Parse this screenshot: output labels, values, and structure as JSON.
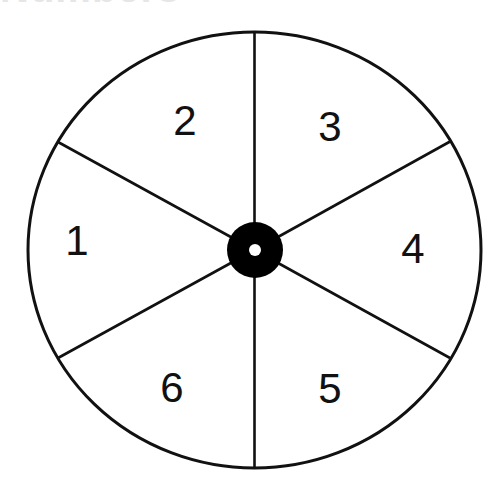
{
  "title_fragment": "Numbers",
  "spinner": {
    "sector_count": 6,
    "stroke_color": "#111111",
    "hub_color": "#000000",
    "background": "#ffffff",
    "sectors": [
      {
        "label": "1",
        "position": "left"
      },
      {
        "label": "2",
        "position": "upper-left"
      },
      {
        "label": "3",
        "position": "upper-right"
      },
      {
        "label": "4",
        "position": "right"
      },
      {
        "label": "5",
        "position": "lower-right"
      },
      {
        "label": "6",
        "position": "lower-left"
      }
    ]
  }
}
